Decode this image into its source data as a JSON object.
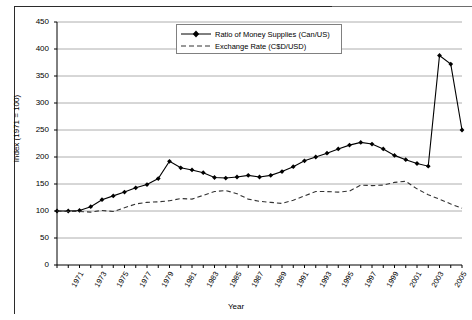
{
  "chart_data": {
    "type": "line",
    "title": "",
    "xlabel": "Year",
    "ylabel": "Index (1971 = 100)",
    "ylim": [
      0,
      450
    ],
    "ytick_step": 50,
    "yticks": [
      0,
      50,
      100,
      150,
      200,
      250,
      300,
      350,
      400,
      450
    ],
    "grid": true,
    "grid_axis": "y",
    "legend_position": "top-center",
    "xlim": [
      1971,
      2007
    ],
    "x": [
      1971,
      1972,
      1973,
      1974,
      1975,
      1976,
      1977,
      1978,
      1979,
      1980,
      1981,
      1982,
      1983,
      1984,
      1985,
      1986,
      1987,
      1988,
      1989,
      1990,
      1991,
      1992,
      1993,
      1994,
      1995,
      1996,
      1997,
      1998,
      1999,
      2000,
      2001,
      2002,
      2003,
      2004,
      2005,
      2006,
      2007
    ],
    "xtick_labels": [
      "1971",
      "1973",
      "1975",
      "1977",
      "1979",
      "1981",
      "1983",
      "1985",
      "1987",
      "1989",
      "1991",
      "1993",
      "1995",
      "1997",
      "1999",
      "2001",
      "2003",
      "2005",
      "2007"
    ],
    "series": [
      {
        "name": "Ratio of Money Supplies (Can/US)",
        "style": "solid",
        "marker": "diamond",
        "color": "#000000",
        "values": [
          100,
          100,
          101,
          108,
          121,
          128,
          135,
          143,
          149,
          160,
          192,
          180,
          176,
          171,
          162,
          161,
          163,
          166,
          163,
          166,
          173,
          182,
          193,
          200,
          207,
          215,
          222,
          227,
          224,
          215,
          203,
          195,
          188,
          183,
          388,
          372,
          250
        ]
      },
      {
        "name": "Exchange Rate (C$D/USD)",
        "style": "dashed",
        "marker": "none",
        "color": "#333333",
        "values": [
          100,
          99,
          99,
          98,
          101,
          99,
          106,
          113,
          116,
          117,
          119,
          123,
          122,
          129,
          136,
          138,
          132,
          122,
          118,
          116,
          114,
          120,
          128,
          136,
          136,
          135,
          137,
          148,
          147,
          148,
          153,
          155,
          141,
          130,
          122,
          113,
          105
        ]
      }
    ],
    "annotations": []
  },
  "legend": {
    "entries": [
      {
        "label": "Ratio of Money Supplies (Can/US)",
        "style": "solid-marker"
      },
      {
        "label": "Exchange Rate (C$D/USD)",
        "style": "dashed"
      }
    ]
  },
  "axes": {
    "y_title": "Index (1971 = 100)",
    "x_title": "Year"
  }
}
